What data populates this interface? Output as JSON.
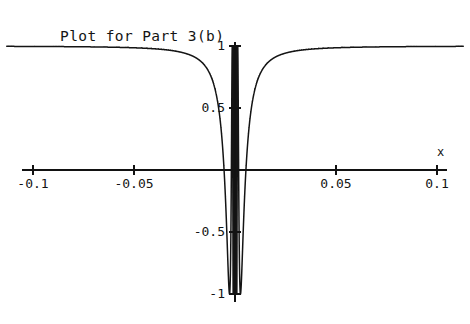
{
  "chart_data": {
    "type": "line",
    "title": "Plot for Part 3(b)",
    "xlabel": "x",
    "ylabel": "",
    "xlim": [
      -0.115,
      0.115
    ],
    "ylim": [
      -1.18,
      1.18
    ],
    "grid": false,
    "legend": null,
    "x_ticks": [
      -0.1,
      -0.05,
      0.05,
      0.1
    ],
    "x_tick_labels": [
      "-0.1",
      "-0.05",
      "0.05",
      "0.1"
    ],
    "y_ticks": [
      -1,
      -0.5,
      0.5,
      1
    ],
    "y_tick_labels": [
      "-1",
      "-0.5",
      "0.5",
      "1"
    ],
    "axis_name_x": "x",
    "series": [
      {
        "name": "chirp",
        "color": "#141414",
        "formula": "cos(k / x)",
        "k": 0.0085,
        "amplitude": 1.0,
        "x_start": -0.113,
        "x_end": 0.113,
        "samples": 24000,
        "peak_amplitude": 1.0,
        "trough_amplitude": -1.0
      }
    ]
  },
  "axes": {
    "x_axis_pixel_y": 170,
    "y_axis_pixel_x": 235,
    "x_axis_pixel_start": 22,
    "x_axis_pixel_end": 447,
    "y_axis_pixel_top": 42,
    "y_axis_pixel_bottom": 302,
    "unit_px_per_x": 2020,
    "unit_px_per_y": 124
  },
  "colors": {
    "background": "#ffffff",
    "ink": "#141414",
    "axis": "#121212"
  }
}
